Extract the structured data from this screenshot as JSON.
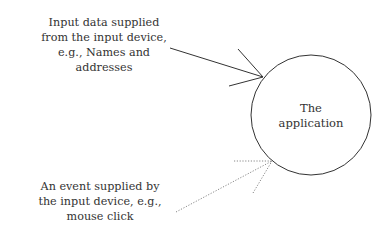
{
  "diagram": {
    "nodes": {
      "application": {
        "label": "The\napplication",
        "shape": "circle"
      }
    },
    "inputs": {
      "data": {
        "label": "Input data supplied\nfrom the input device,\ne.g., Names and\naddresses",
        "arrow_style": "solid"
      },
      "event": {
        "label": "An event supplied by\nthe input device, e.g.,\nmouse click",
        "arrow_style": "dotted"
      }
    }
  },
  "colors": {
    "stroke": "#333333",
    "dotted_stroke": "#888888",
    "text": "#333333",
    "background": "#ffffff"
  }
}
